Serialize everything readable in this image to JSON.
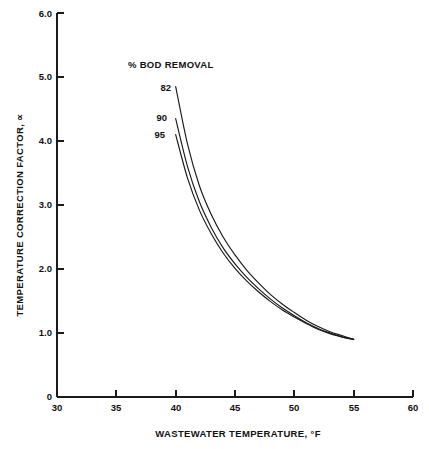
{
  "chart_data": {
    "type": "line",
    "title": "",
    "xlabel": "WASTEWATER TEMPERATURE, °F",
    "ylabel": "TEMPERATURE CORRECTION FACTOR, ∝",
    "legend_title": "% BOD REMOVAL",
    "legend_position": "inside-upper-left",
    "grid": false,
    "xlim": [
      30,
      60
    ],
    "ylim": [
      0,
      6.0
    ],
    "xticks": [
      "30",
      "35",
      "40",
      "45",
      "50",
      "55",
      "60"
    ],
    "xtick_values": [
      30,
      35,
      40,
      45,
      50,
      55,
      60
    ],
    "yticks": [
      "0",
      "1.0",
      "2.0",
      "3.0",
      "4.0",
      "5.0",
      "6.0"
    ],
    "ytick_values": [
      0,
      1.0,
      2.0,
      3.0,
      4.0,
      5.0,
      6.0
    ],
    "x": [
      40,
      41,
      42,
      43,
      44,
      45,
      46,
      47,
      48,
      49,
      50,
      51,
      52,
      53,
      54,
      55
    ],
    "series": [
      {
        "name": "82",
        "label": "82",
        "values": [
          4.85,
          3.95,
          3.3,
          2.85,
          2.5,
          2.22,
          1.98,
          1.78,
          1.6,
          1.45,
          1.32,
          1.2,
          1.1,
          1.02,
          0.96,
          0.9
        ]
      },
      {
        "name": "90",
        "label": "90",
        "values": [
          4.35,
          3.6,
          3.05,
          2.65,
          2.33,
          2.08,
          1.87,
          1.69,
          1.53,
          1.39,
          1.27,
          1.16,
          1.07,
          1.0,
          0.94,
          0.9
        ]
      },
      {
        "name": "95",
        "label": "95",
        "values": [
          4.1,
          3.42,
          2.92,
          2.55,
          2.25,
          2.01,
          1.81,
          1.64,
          1.49,
          1.36,
          1.25,
          1.15,
          1.06,
          0.99,
          0.94,
          0.9
        ]
      }
    ]
  }
}
